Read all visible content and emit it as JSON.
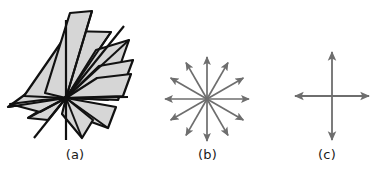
{
  "figure": {
    "background_color": "#ffffff",
    "width": 389,
    "height": 178,
    "panels": [
      {
        "id": "a",
        "caption": "(a)",
        "description": "pencil-of-planes",
        "plane_fill_color": "#d6d6d6",
        "plane_stroke_color": "#111111",
        "line_color": "#111111"
      },
      {
        "id": "b",
        "caption": "(b)",
        "description": "twelve-radial-arrows",
        "arrow_color": "#6e6e6e",
        "arrow_count": 12,
        "angle_step_degrees": 30,
        "radius": 42,
        "center_x": 57,
        "center_y": 99
      },
      {
        "id": "c",
        "caption": "(c)",
        "description": "four-arrow-cross",
        "arrow_color": "#6e6e6e",
        "arrow_count": 4,
        "angles_degrees": [
          0,
          90,
          180,
          270
        ],
        "radius_horizontal": 37,
        "radius_vertical": 44,
        "center_x": 67,
        "center_y": 96
      }
    ]
  }
}
